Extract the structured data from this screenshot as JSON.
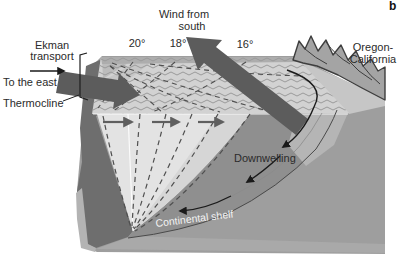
{
  "labels": {
    "panel": "b",
    "wind_line1": "Wind from",
    "wind_line2": "south",
    "ekman_line1": "Ekman",
    "ekman_line2": "transport",
    "to_the_east": "To the east",
    "thermocline": "Thermocline",
    "downwelling": "Downwelling",
    "continental_shelf": "Continental shelf",
    "region_line1": "Oregon-",
    "region_line2": "California"
  },
  "isotherm_labels": [
    "20°",
    "18°",
    "16°"
  ],
  "colors": {
    "background": "#ffffff",
    "ocean_surface": "#d2d2d2",
    "wave_lines": "#9a9a9a",
    "warm_layer_wedge": "#e3e3e3",
    "deep_water_face": "#6e6e6e",
    "slope_face": "#8f8f8f",
    "base_gray": "#9e9e9e",
    "coastal_strip": "#c6c6c6",
    "mountains": "#a4a4a4",
    "large_arrows": "#5c5c5c",
    "thin_arrows": "#1a1a1a",
    "dashed_isotherms": "#4f4f4f",
    "text": "#2b2b2b",
    "shelf_label_text": "#f2f2f2"
  }
}
